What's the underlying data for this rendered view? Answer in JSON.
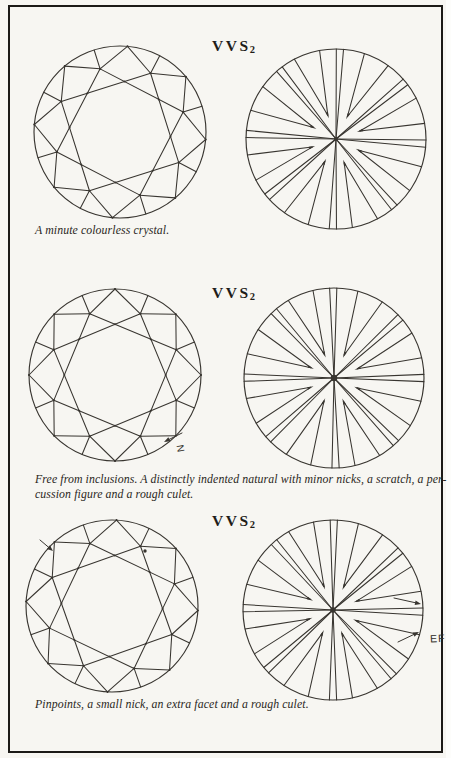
{
  "page": {
    "background": "#f7f6f2",
    "line_color": "#383530",
    "text_color": "#2a2722",
    "frame_color": "#1c1a17"
  },
  "sections": [
    {
      "grade": "VVS",
      "grade_subscript": "2",
      "caption_lines": [
        "A minute colourless crystal."
      ],
      "annotations": []
    },
    {
      "grade": "VVS",
      "grade_subscript": "2",
      "caption_lines": [
        "Free from inclusions. A distinctly indented natural with minor nicks, a scratch, a per-",
        "cussion figure and a rough culet."
      ],
      "annotations": [
        {
          "label": "N"
        }
      ]
    },
    {
      "grade": "VVS",
      "grade_subscript": "2",
      "caption_lines": [
        "Pinpoints, a small nick, an extra facet and a rough culet."
      ],
      "annotations": [
        {
          "label": "EF"
        }
      ]
    }
  ]
}
